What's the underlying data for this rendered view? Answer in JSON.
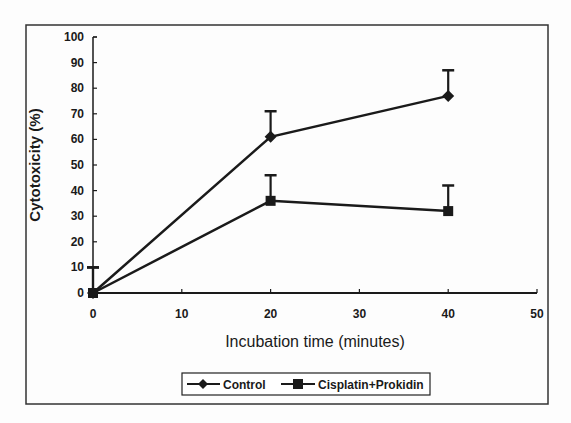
{
  "chart_data": {
    "type": "line",
    "title": "",
    "xlabel": "Incubation time (minutes)",
    "ylabel": "Cytotoxicity (%)",
    "x_ticks": [
      0,
      10,
      20,
      30,
      40,
      50
    ],
    "y_ticks": [
      0,
      10,
      20,
      30,
      40,
      50,
      60,
      70,
      80,
      90,
      100
    ],
    "xlim": [
      0,
      50
    ],
    "ylim": [
      0,
      100
    ],
    "grid": false,
    "legend_position": "bottom",
    "series": [
      {
        "name": "Control",
        "marker": "diamond",
        "x": [
          0,
          20,
          40
        ],
        "values": [
          0,
          61,
          77
        ],
        "error_upper": [
          10,
          10,
          10
        ]
      },
      {
        "name": "Cisplatin+Prokidin",
        "marker": "square",
        "x": [
          0,
          20,
          40
        ],
        "values": [
          0,
          36,
          32
        ],
        "error_upper": [
          10,
          10,
          10
        ]
      }
    ]
  },
  "colors": {
    "ink": "#1a1a1a",
    "background": "#fdfdfd"
  }
}
